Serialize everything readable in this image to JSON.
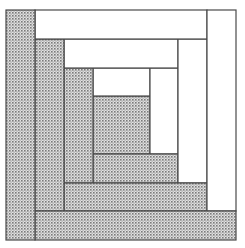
{
  "diagram": {
    "colors": {
      "stroke": "#4a4a4a",
      "light": "#ffffff",
      "dark_base": "#e2e2e2",
      "dark_dot": "#7a7a7a"
    },
    "pieces": [
      {
        "id": "center",
        "fill": "dark",
        "x": 93,
        "y": 96,
        "w": 57,
        "h": 58
      },
      {
        "id": "r1-top",
        "fill": "light",
        "x": 93,
        "y": 68,
        "w": 57,
        "h": 28
      },
      {
        "id": "r1-right",
        "fill": "light",
        "x": 150,
        "y": 68,
        "w": 28,
        "h": 86
      },
      {
        "id": "r1-bottom",
        "fill": "dark",
        "x": 93,
        "y": 154,
        "w": 85,
        "h": 29
      },
      {
        "id": "r1-left",
        "fill": "dark",
        "x": 64,
        "y": 68,
        "w": 29,
        "h": 115
      },
      {
        "id": "r2-top",
        "fill": "light",
        "x": 64,
        "y": 39,
        "w": 114,
        "h": 29
      },
      {
        "id": "r2-right",
        "fill": "light",
        "x": 178,
        "y": 39,
        "w": 29,
        "h": 144
      },
      {
        "id": "r2-bottom",
        "fill": "dark",
        "x": 64,
        "y": 183,
        "w": 143,
        "h": 28
      },
      {
        "id": "r2-left",
        "fill": "dark",
        "x": 35,
        "y": 39,
        "w": 29,
        "h": 172
      },
      {
        "id": "r3-top",
        "fill": "light",
        "x": 35,
        "y": 10,
        "w": 172,
        "h": 29
      },
      {
        "id": "r3-right",
        "fill": "light",
        "x": 207,
        "y": 10,
        "w": 29,
        "h": 201
      },
      {
        "id": "r3-bottom",
        "fill": "dark",
        "x": 35,
        "y": 211,
        "w": 201,
        "h": 29
      },
      {
        "id": "r3-left",
        "fill": "dark",
        "x": 6,
        "y": 10,
        "w": 29,
        "h": 230
      }
    ]
  }
}
